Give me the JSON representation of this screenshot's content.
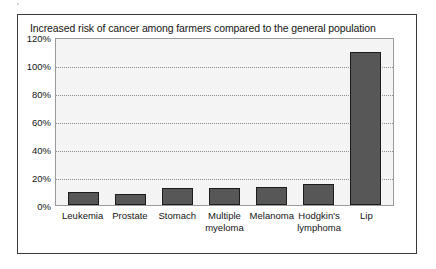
{
  "figure": {
    "title": "Increased risk of cancer among farmers compared to the general population",
    "artifact_mark": "′",
    "frame_color": "#3a3a3a",
    "plot_background": "#f4f4f4",
    "bar_color": "#575757",
    "bar_border_color": "#1c1c1c",
    "gridline_color": "#8d8d8d"
  },
  "chart_data": {
    "type": "bar",
    "title": "Increased risk of cancer among farmers compared to the general population",
    "xlabel": "",
    "ylabel": "",
    "categories": [
      "Leukemia",
      "Prostate",
      "Stomach",
      "Multiple myeloma",
      "Melanoma",
      "Hodgkin's lymphoma",
      "Lip"
    ],
    "category_lines": [
      [
        "Leukemia"
      ],
      [
        "Prostate"
      ],
      [
        "Stomach"
      ],
      [
        "Multiple",
        "myeloma"
      ],
      [
        "Melanoma"
      ],
      [
        "Hodgkin's",
        "lymphoma"
      ],
      [
        "Lip"
      ]
    ],
    "values": [
      9,
      8,
      12,
      12,
      13,
      15,
      109
    ],
    "ylim": [
      0,
      120
    ],
    "ytick_values": [
      0,
      20,
      40,
      60,
      80,
      100,
      120
    ],
    "ytick_labels": [
      "0%",
      "20%",
      "40%",
      "60%",
      "80%",
      "100%",
      "120%"
    ],
    "grid": true,
    "grid_axis": "y",
    "legend": false,
    "legend_position": "none"
  }
}
